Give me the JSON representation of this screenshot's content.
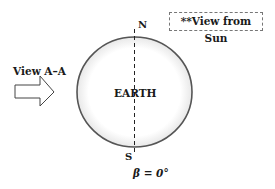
{
  "diagram": {
    "note": "**View from Sun",
    "view_label": "View A–A",
    "body_label": "EARTH",
    "north_label": "N",
    "south_label": "S",
    "beta_label": "β = 0°",
    "colors": {
      "outline": "#555555",
      "text": "#1a1a1a",
      "box_border": "#777777"
    }
  }
}
